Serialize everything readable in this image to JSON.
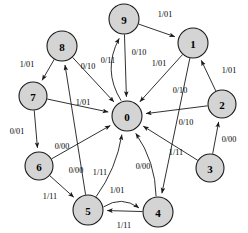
{
  "diagram": {
    "type": "state-transition-diagram",
    "title": "",
    "background_color": "#ffffff",
    "node_fill_color": "#d4d4d4",
    "node_stroke_color": "#1a1a1a",
    "edge_color": "#1a1a1a",
    "label_format": "input/output",
    "nodes": [
      {
        "id": "0",
        "label": "0",
        "cx": 127,
        "cy": 116,
        "r": 15
      },
      {
        "id": "1",
        "label": "1",
        "cx": 193,
        "cy": 43,
        "r": 15
      },
      {
        "id": "2",
        "label": "2",
        "cx": 222,
        "cy": 104,
        "r": 14
      },
      {
        "id": "3",
        "label": "3",
        "cx": 210,
        "cy": 168,
        "r": 14
      },
      {
        "id": "4",
        "label": "4",
        "cx": 158,
        "cy": 212,
        "r": 15
      },
      {
        "id": "5",
        "label": "5",
        "cx": 88,
        "cy": 210,
        "r": 15
      },
      {
        "id": "6",
        "label": "6",
        "cx": 39,
        "cy": 166,
        "r": 14
      },
      {
        "id": "7",
        "label": "7",
        "cx": 33,
        "cy": 96,
        "r": 14
      },
      {
        "id": "8",
        "label": "8",
        "cx": 62,
        "cy": 46,
        "r": 15
      },
      {
        "id": "9",
        "label": "9",
        "cx": 124,
        "cy": 19,
        "r": 15
      }
    ],
    "edges": [
      {
        "from": "9",
        "to": "1",
        "label": "1/01",
        "lx": 165,
        "ly": 14,
        "curve": 0
      },
      {
        "from": "9",
        "to": "0",
        "label": "0/10",
        "lx": 139,
        "ly": 52,
        "curve": 0
      },
      {
        "from": "0",
        "to": "9",
        "label": "0/11",
        "lx": 108,
        "ly": 60,
        "curve": -18
      },
      {
        "from": "1",
        "to": "0",
        "label": "1/01",
        "lx": 159,
        "ly": 63,
        "curve": 0
      },
      {
        "from": "1",
        "to": "4",
        "label": "0/10",
        "lx": 180,
        "ly": 90,
        "curve": 0
      },
      {
        "from": "2",
        "to": "1",
        "label": "1/01",
        "lx": 229,
        "ly": 70,
        "curve": 0
      },
      {
        "from": "2",
        "to": "0",
        "label": "0/10",
        "lx": 186,
        "ly": 122,
        "curve": 0
      },
      {
        "from": "3",
        "to": "2",
        "label": "0/00",
        "lx": 229,
        "ly": 139,
        "curve": 0
      },
      {
        "from": "3",
        "to": "0",
        "label": "1/11",
        "lx": 176,
        "ly": 152,
        "curve": 0
      },
      {
        "from": "4",
        "to": "0",
        "label": "0/00",
        "lx": 143,
        "ly": 166,
        "curve": 10
      },
      {
        "from": "4",
        "to": "5",
        "label": "1/11",
        "lx": 124,
        "ly": 225,
        "curve": 0
      },
      {
        "from": "5",
        "to": "4",
        "label": "1/01",
        "lx": 117,
        "ly": 190,
        "curve": -12
      },
      {
        "from": "5",
        "to": "0",
        "label": "1/11",
        "lx": 100,
        "ly": 172,
        "curve": 8
      },
      {
        "from": "5",
        "to": "8",
        "label": "0/00",
        "lx": 76,
        "ly": 170,
        "curve": 0
      },
      {
        "from": "6",
        "to": "5",
        "label": "1/11",
        "lx": 50,
        "ly": 196,
        "curve": 0
      },
      {
        "from": "6",
        "to": "0",
        "label": "0/00",
        "lx": 62,
        "ly": 146,
        "curve": 0
      },
      {
        "from": "7",
        "to": "6",
        "label": "0/01",
        "lx": 17,
        "ly": 131,
        "curve": 0
      },
      {
        "from": "7",
        "to": "0",
        "label": "1/01",
        "lx": 83,
        "ly": 102,
        "curve": 0
      },
      {
        "from": "8",
        "to": "7",
        "label": "1/01",
        "lx": 27,
        "ly": 64,
        "curve": 0
      },
      {
        "from": "8",
        "to": "0",
        "label": "0/10",
        "lx": 88,
        "ly": 66,
        "curve": 0
      }
    ]
  }
}
